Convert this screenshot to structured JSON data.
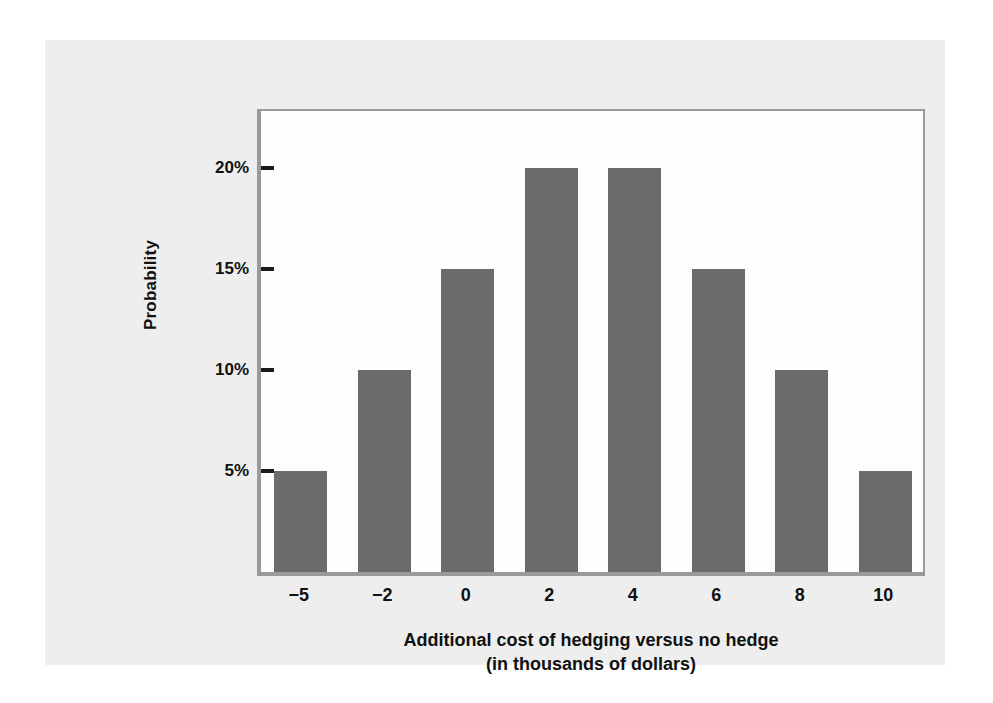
{
  "figure": {
    "panel_background": "#eeeeee",
    "page_background": "#ffffff",
    "plot_background": "#fdfdfd",
    "frame_color": "#9a9a9a",
    "bar_color": "#6b6b6b",
    "text_color": "#111111"
  },
  "chart_data": {
    "type": "bar",
    "title": "",
    "subtitle": "",
    "xlabel": "Additional cost of hedging versus no hedge",
    "xlabel_line2": "(in thousands of dollars)",
    "ylabel": "Probability",
    "categories": [
      "−5",
      "−2",
      "0",
      "2",
      "4",
      "6",
      "8",
      "10"
    ],
    "values": [
      5,
      10,
      15,
      20,
      20,
      15,
      10,
      5
    ],
    "value_labels": [
      "5%",
      "10%",
      "15%",
      "20%",
      "20%",
      "15%",
      "10%",
      "5%"
    ],
    "ylim": [
      0,
      23
    ],
    "ytick_values": [
      5,
      10,
      15,
      20
    ],
    "ytick_labels": [
      "5%",
      "10%",
      "15%",
      "20%"
    ],
    "grid": false,
    "legend": false,
    "legend_position": "none",
    "bar_color": "#6b6b6b",
    "series": [
      {
        "name": "Probability",
        "values": [
          5,
          10,
          15,
          20,
          20,
          15,
          10,
          5
        ]
      }
    ]
  }
}
